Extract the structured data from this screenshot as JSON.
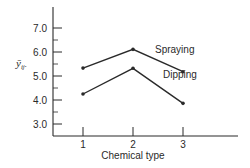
{
  "chart_data": {
    "type": "line",
    "title": "",
    "xlabel": "Chemical type",
    "ylabel": "ȳij.",
    "categories": [
      "1",
      "2",
      "3"
    ],
    "x": [
      1,
      2,
      3
    ],
    "series": [
      {
        "name": "Spraying",
        "values": [
          5.33,
          6.11,
          5.18
        ]
      },
      {
        "name": "Dipping",
        "values": [
          4.25,
          5.32,
          3.86
        ]
      }
    ],
    "yticks": [
      "3.0",
      "4.0",
      "5.0",
      "6.0",
      "7.0"
    ],
    "ylim": [
      2.5,
      7.9
    ],
    "grid": false,
    "legend": "inline labels next to lines",
    "colors": {
      "line": "#2a2a2a",
      "axis": "#2a2a2a",
      "background": "#ffffff"
    }
  }
}
